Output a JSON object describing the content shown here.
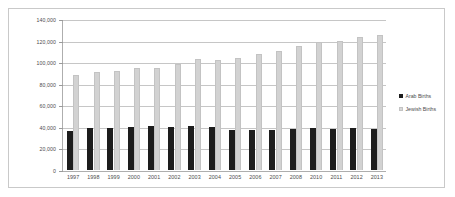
{
  "chart_data": {
    "type": "bar",
    "title": "",
    "xlabel": "",
    "ylabel": "",
    "grid": true,
    "legend_position": "right",
    "ylim": [
      0,
      140000
    ],
    "yticks": [
      "0",
      "20,000",
      "40,000",
      "60,000",
      "80,000",
      "100,000",
      "120,000",
      "140,000"
    ],
    "ytick_values": [
      0,
      20000,
      40000,
      60000,
      80000,
      100000,
      120000,
      140000
    ],
    "categories": [
      "1997",
      "1998",
      "1999",
      "2000",
      "2001",
      "2002",
      "2003",
      "2004",
      "2005",
      "2006",
      "2007",
      "2008",
      "2010",
      "2011",
      "2012",
      "2013"
    ],
    "series": [
      {
        "name": "Arab Births",
        "color": "#1d1d1d",
        "values": [
          36000,
          38500,
          39000,
          40000,
          40500,
          39800,
          40400,
          39500,
          37500,
          37500,
          37500,
          37600,
          39000,
          38200,
          38500,
          37700
        ]
      },
      {
        "name": "Jewish Births",
        "color": "#d2d2d2",
        "values": [
          88000,
          90800,
          92000,
          95000,
          94500,
          98000,
          102500,
          102300,
          103800,
          107200,
          110000,
          115000,
          119000,
          120000,
          123500,
          125000
        ]
      }
    ]
  },
  "legend": {
    "items": [
      {
        "label": "Arab Births"
      },
      {
        "label": "Jewish Births"
      }
    ]
  }
}
